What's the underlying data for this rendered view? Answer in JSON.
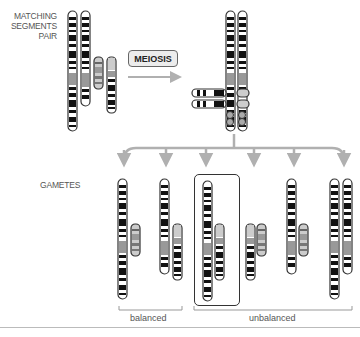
{
  "labels": {
    "matching_segments": [
      "MATCHING",
      "SEGMENTS",
      "PAIR"
    ],
    "meiosis": "MEIOSIS",
    "gametes": "GAMETES",
    "balanced": "balanced",
    "unbalanced": "unbalanced"
  },
  "colors": {
    "chromosome_outline": "#333333",
    "band_dark": "#111111",
    "band_light": "#ffffff",
    "translocated_segment": "#9a9a9a",
    "arrow": "#b0b0b0",
    "label_text": "#555555"
  },
  "gametes": [
    {
      "id": 1,
      "type": "balanced"
    },
    {
      "id": 2,
      "type": "balanced"
    },
    {
      "id": 3,
      "type": "unbalanced",
      "highlighted": true
    },
    {
      "id": 4,
      "type": "unbalanced"
    },
    {
      "id": 5,
      "type": "unbalanced"
    },
    {
      "id": 6,
      "type": "unbalanced"
    }
  ]
}
